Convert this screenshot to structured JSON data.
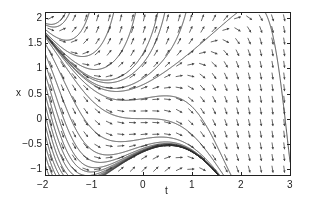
{
  "chart_data": {
    "type": "direction-field",
    "title": "",
    "xlabel": "t",
    "ylabel": "x",
    "equation": "dx/dt = x^2 - t^2",
    "xlim": [
      -2,
      3
    ],
    "ylim": [
      -1.12,
      2.12
    ],
    "xticks": [
      -2,
      -1,
      0,
      1,
      2,
      3
    ],
    "xtick_labels": [
      "−2",
      "−1",
      "0",
      "1",
      "2",
      "3"
    ],
    "yticks": [
      -1,
      -0.5,
      0,
      0.5,
      1,
      1.5,
      2
    ],
    "ytick_labels": [
      "−1",
      "−0.5",
      "0",
      "0.5",
      "1",
      "1.5",
      "2"
    ],
    "grid": false,
    "arrow_grid": {
      "nt": 21,
      "nx": 14
    },
    "solution_curves_initial_points": [
      [
        -2,
        2.1
      ],
      [
        -2,
        1.9
      ],
      [
        -2,
        1.7
      ],
      [
        -2,
        1.5
      ],
      [
        -2,
        1.3
      ],
      [
        -2,
        1.1
      ],
      [
        -2,
        0.9
      ],
      [
        -2,
        0.7
      ],
      [
        -2,
        0.5
      ],
      [
        -2,
        0.3
      ],
      [
        -2,
        0.1
      ],
      [
        -2,
        -0.1
      ],
      [
        -2,
        -0.3
      ],
      [
        -2,
        -0.5
      ],
      [
        -2,
        -0.7
      ],
      [
        -2,
        -0.9
      ],
      [
        0,
        0
      ],
      [
        0,
        0.4
      ],
      [
        0,
        0.8
      ],
      [
        0,
        1.1
      ],
      [
        -0.6,
        2.1
      ],
      [
        -1.1,
        2.1
      ],
      [
        -1.5,
        2.1
      ],
      [
        2.5,
        2.1
      ],
      [
        0.3,
        2.1
      ]
    ],
    "line_color": "#333333",
    "arrow_color": "#444444"
  },
  "axes": {
    "x_label": "t",
    "y_label": "x"
  }
}
